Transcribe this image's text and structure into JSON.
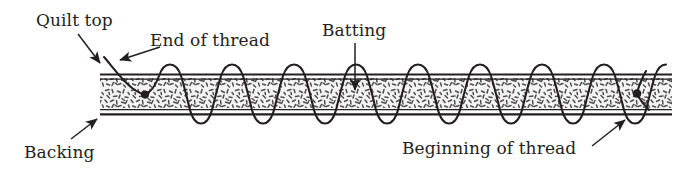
{
  "figure": {
    "type": "cross-section-diagram",
    "width": 674,
    "height": 178,
    "background_color": "#ffffff",
    "ink_color": "#231f20",
    "batting_fill_color": "#f2f2f2",
    "batting_speckle_color": "#58585a"
  },
  "labels": {
    "quilt_top": "Quilt top",
    "end_of_thread": "End of thread",
    "batting": "Batting",
    "backing": "Backing",
    "beginning_of_thread": "Beginning of thread"
  },
  "icons": {
    "quilt_top_arrow": "arrow-down-left-icon",
    "end_of_thread_arrow": "arrow-down-left-icon",
    "batting_arrow": "arrow-down-icon",
    "backing_arrow": "arrow-up-right-icon",
    "beginning_of_thread_arrow": "arrow-up-right-icon"
  },
  "geometry": {
    "quilt_left": 100,
    "quilt_right": 672,
    "top_layer_line_1_y": 74,
    "top_layer_line_2_y": 78,
    "batting_top_y": 78,
    "batting_bottom_y": 108,
    "bottom_layer_line_1_y": 110,
    "bottom_layer_line_2_y": 115,
    "stitch_crest_y": 66,
    "stitch_trough_y": 124,
    "stitch_wave_count": 11,
    "thread_end_knot": {
      "x": 145,
      "y": 94
    },
    "thread_begin_knot": {
      "x": 637,
      "y": 93
    }
  },
  "callouts": [
    {
      "name": "quilt-top",
      "from": {
        "x": 78,
        "y": 36
      },
      "to": {
        "x": 104,
        "y": 68
      }
    },
    {
      "name": "end-of-thread",
      "from": {
        "x": 156,
        "y": 46
      },
      "to": {
        "x": 120,
        "y": 64
      }
    },
    {
      "name": "batting",
      "from": {
        "x": 355,
        "y": 44
      },
      "to": {
        "x": 355,
        "y": 95
      }
    },
    {
      "name": "backing",
      "from": {
        "x": 72,
        "y": 140
      },
      "to": {
        "x": 99,
        "y": 116
      }
    },
    {
      "name": "beginning-of-thread",
      "from": {
        "x": 594,
        "y": 146
      },
      "to": {
        "x": 627,
        "y": 118
      }
    }
  ]
}
